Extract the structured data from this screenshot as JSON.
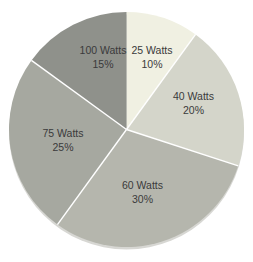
{
  "chart_data": {
    "type": "pie",
    "title": "",
    "categories": [
      "25 Watts",
      "40 Watts",
      "60 Watts",
      "75 Watts",
      "100 Watts"
    ],
    "values": [
      10,
      20,
      30,
      25,
      15
    ],
    "value_unit": "percent",
    "direction": "clockwise",
    "start_angle_deg": 0,
    "legend_position": "none",
    "labels": "inside",
    "label_color": "#3a3a3b",
    "separator_color": "#ffffff",
    "background_color": "#ffffff",
    "shadow_color": "#d7d7d3",
    "slices": [
      {
        "label": "25 Watts",
        "value": 10,
        "display_percent": "10%",
        "color": "#f0f0e2",
        "label_x": 152,
        "label_y": 57
      },
      {
        "label": "40 Watts",
        "value": 20,
        "display_percent": "20%",
        "color": "#d4d5ca",
        "label_x": 193.5,
        "label_y": 103.5
      },
      {
        "label": "60 Watts",
        "value": 30,
        "display_percent": "30%",
        "color": "#b5b6ad",
        "label_x": 142.5,
        "label_y": 192
      },
      {
        "label": "75 Watts",
        "value": 25,
        "display_percent": "25%",
        "color": "#a6a8a0",
        "label_x": 63,
        "label_y": 140
      },
      {
        "label": "100 Watts",
        "value": 15,
        "display_percent": "15%",
        "color": "#8f918b",
        "label_x": 103,
        "label_y": 57
      }
    ],
    "geometry": {
      "cx": 126.5,
      "cy": 129.5,
      "r": 117.5,
      "canvas_width": 253,
      "canvas_height": 262
    }
  }
}
